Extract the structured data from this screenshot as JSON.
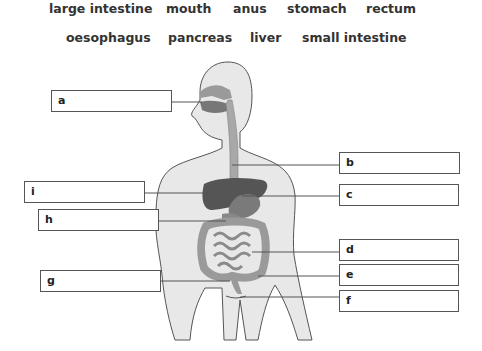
{
  "word_bank": {
    "row1": [
      "large intestine",
      "mouth",
      "anus",
      "stomach",
      "rectum"
    ],
    "row2": [
      "oesophagus",
      "pancreas",
      "liver",
      "small intestine"
    ]
  },
  "labels": {
    "a": "a",
    "b": "b",
    "c": "c",
    "d": "d",
    "e": "e",
    "f": "f",
    "g": "g",
    "h": "h",
    "i": "i"
  },
  "colors": {
    "body_fill": "#e8e8e8",
    "body_outline": "#555555",
    "organ_dark": "#555555",
    "intestine": "#9a9a9a",
    "box_border": "#555555"
  }
}
